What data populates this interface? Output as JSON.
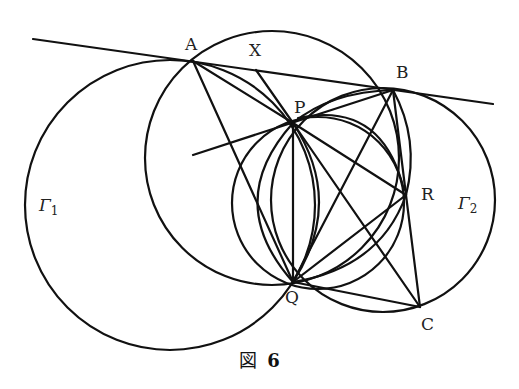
{
  "figure": {
    "caption_prefix": "図",
    "caption_number": "6",
    "stroke_color": "#111111",
    "background": "#ffffff"
  },
  "points": {
    "A": {
      "label": "A",
      "x": 193,
      "y": 61
    },
    "B": {
      "label": "B",
      "x": 393,
      "y": 90
    },
    "X": {
      "label": "X",
      "x": 256,
      "y": 70
    },
    "P": {
      "label": "P",
      "x": 293,
      "y": 123
    },
    "Q": {
      "label": "Q",
      "x": 293,
      "y": 282
    },
    "R": {
      "label": "R",
      "x": 406,
      "y": 195
    },
    "C": {
      "label": "C",
      "x": 420,
      "y": 307
    }
  },
  "circles": {
    "gamma1": {
      "label": "Γ",
      "subscript": "1",
      "cx": 170,
      "cy": 205,
      "r": 145
    },
    "gamma2": {
      "label": "Γ",
      "subscript": "2",
      "cx": 383,
      "cy": 200,
      "r": 112
    },
    "big_ABQ": {
      "cx": 272,
      "cy": 158,
      "r": 127
    },
    "inner_PRQ": {
      "cx": 318,
      "cy": 203,
      "r": 86
    }
  },
  "tangent_line": {
    "x1": 33,
    "y1": 39,
    "x2": 493,
    "y2": 104
  }
}
